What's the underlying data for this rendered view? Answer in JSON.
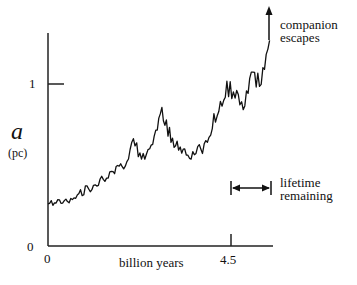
{
  "chart_data": {
    "type": "line",
    "title": "",
    "xlabel": "billion years",
    "ylabel": "a",
    "ylabel_unit": "(pc)",
    "x_ticks": [
      {
        "value": 0,
        "label": "0"
      },
      {
        "value": 4.5,
        "label": "4.5"
      }
    ],
    "y_ticks": [
      {
        "value": 0,
        "label": "0"
      },
      {
        "value": 1,
        "label": "1"
      }
    ],
    "xlim": [
      0,
      5.5
    ],
    "ylim": [
      0,
      1.3
    ],
    "grid": false,
    "legend": null,
    "series": [
      {
        "name": "binary semi-major axis",
        "style": "noisy random-walk line",
        "x": [
          0.0,
          0.4,
          0.8,
          1.2,
          1.6,
          1.9,
          2.1,
          2.3,
          2.5,
          2.8,
          3.1,
          3.4,
          3.6,
          3.8,
          4.0,
          4.2,
          4.4,
          4.6,
          4.8,
          5.0,
          5.2,
          5.45
        ],
        "y": [
          0.26,
          0.27,
          0.33,
          0.38,
          0.45,
          0.5,
          0.64,
          0.55,
          0.6,
          0.82,
          0.62,
          0.58,
          0.57,
          0.6,
          0.72,
          0.85,
          0.98,
          0.95,
          0.82,
          1.05,
          1.0,
          1.27
        ]
      }
    ],
    "annotations": [
      {
        "text": "companion escapes",
        "type": "arrow-up",
        "at_x": 5.45,
        "at_y": 1.27
      },
      {
        "text": "lifetime remaining",
        "type": "double-arrow-span",
        "x_from": 4.5,
        "x_to": 5.5
      }
    ]
  },
  "labels": {
    "y_axis_symbol": "a",
    "y_axis_unit": "(pc)",
    "y_tick_0": "0",
    "y_tick_1": "1",
    "x_tick_0": "0",
    "x_tick_45": "4.5",
    "x_axis_title": "billion years",
    "annotation_escape_line1": "companion",
    "annotation_escape_line2": "escapes",
    "annotation_lifetime_line1": "lifetime",
    "annotation_lifetime_line2": "remaining"
  },
  "colors": {
    "ink": "#111111",
    "background": "#ffffff"
  }
}
